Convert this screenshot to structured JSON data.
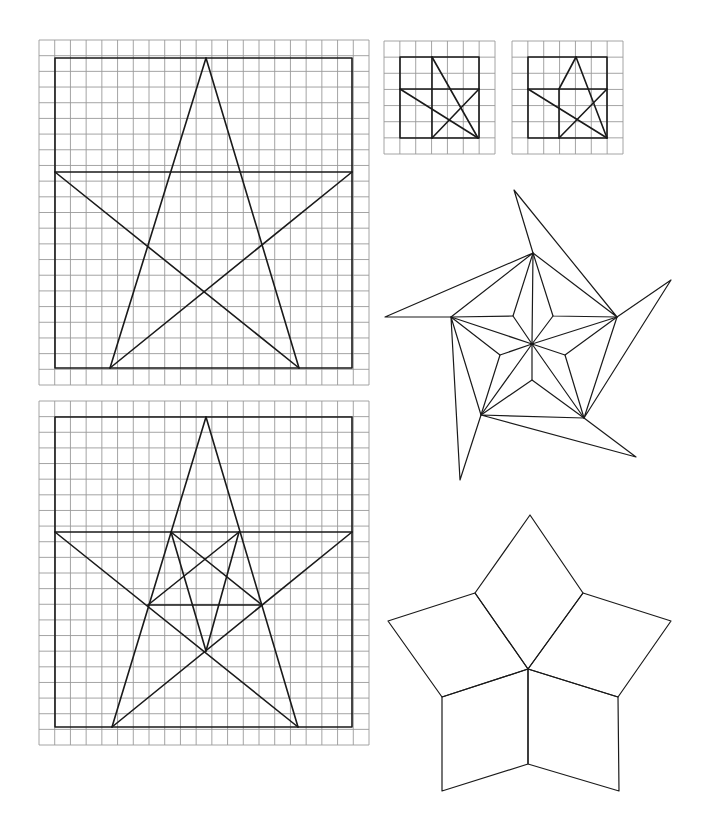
{
  "page": {
    "width": 703,
    "height": 836,
    "background": "#ffffff",
    "ink": "#1a1a1a",
    "grid_color": "#9a9a9a"
  },
  "figures": [
    {
      "id": "grid-star-large-top",
      "grid": {
        "x0": 39,
        "y0": 40,
        "x1": 369,
        "y1": 385,
        "cols": 21,
        "rows": 22
      },
      "frame": [
        [
          55,
          58
        ],
        [
          352,
          58
        ],
        [
          352,
          368
        ],
        [
          55,
          368
        ]
      ],
      "lines": [
        [
          [
            55,
            172
          ],
          [
            352,
            172
          ]
        ],
        [
          [
            206,
            58
          ],
          [
            110,
            368
          ]
        ],
        [
          [
            206,
            58
          ],
          [
            299,
            368
          ]
        ],
        [
          [
            55,
            172
          ],
          [
            299,
            368
          ]
        ],
        [
          [
            352,
            172
          ],
          [
            110,
            368
          ]
        ]
      ]
    },
    {
      "id": "grid-star-small-1",
      "grid": {
        "x0": 384,
        "y0": 41,
        "x1": 495,
        "y1": 154,
        "cols": 7,
        "rows": 7
      },
      "frame": [
        [
          400,
          57
        ],
        [
          479,
          57
        ],
        [
          479,
          138
        ],
        [
          400,
          138
        ]
      ],
      "lines": [
        [
          [
            400,
            89
          ],
          [
            479,
            89
          ]
        ],
        [
          [
            432,
            57
          ],
          [
            432,
            138
          ]
        ],
        [
          [
            432,
            57
          ],
          [
            478,
            138
          ]
        ],
        [
          [
            400,
            89
          ],
          [
            478,
            138
          ]
        ],
        [
          [
            479,
            89
          ],
          [
            432,
            138
          ]
        ]
      ]
    },
    {
      "id": "grid-star-small-2",
      "grid": {
        "x0": 512,
        "y0": 41,
        "x1": 623,
        "y1": 154,
        "cols": 7,
        "rows": 7
      },
      "frame": [
        [
          528,
          57
        ],
        [
          607,
          57
        ],
        [
          607,
          138
        ],
        [
          528,
          138
        ]
      ],
      "lines": [
        [
          [
            528,
            89
          ],
          [
            607,
            89
          ]
        ],
        [
          [
            576,
            57
          ],
          [
            559,
            89
          ]
        ],
        [
          [
            559,
            89
          ],
          [
            559,
            138
          ]
        ],
        [
          [
            576,
            57
          ],
          [
            607,
            138
          ]
        ],
        [
          [
            528,
            89
          ],
          [
            607,
            138
          ]
        ],
        [
          [
            607,
            89
          ],
          [
            559,
            138
          ]
        ]
      ]
    },
    {
      "id": "grid-star-large-bottom",
      "grid": {
        "x0": 39,
        "y0": 401,
        "x1": 369,
        "y1": 745,
        "cols": 21,
        "rows": 22
      },
      "frame": [
        [
          55,
          417
        ],
        [
          352,
          417
        ],
        [
          352,
          727
        ],
        [
          55,
          727
        ]
      ],
      "lines": [
        [
          [
            55,
            532
          ],
          [
            352,
            532
          ]
        ],
        [
          [
            206,
            417
          ],
          [
            112,
            727
          ]
        ],
        [
          [
            206,
            417
          ],
          [
            298,
            727
          ]
        ],
        [
          [
            55,
            532
          ],
          [
            298,
            727
          ]
        ],
        [
          [
            352,
            532
          ],
          [
            112,
            727
          ]
        ],
        [
          [
            148,
            605
          ],
          [
            262,
            605
          ]
        ],
        [
          [
            171,
            532
          ],
          [
            206,
            651
          ]
        ],
        [
          [
            239,
            532
          ],
          [
            206,
            651
          ]
        ],
        [
          [
            171,
            532
          ],
          [
            262,
            605
          ]
        ],
        [
          [
            239,
            532
          ],
          [
            148,
            605
          ]
        ]
      ]
    },
    {
      "id": "pinwheel-star",
      "center": [
        532,
        344
      ],
      "tips": [
        [
          533,
          253
        ],
        [
          617,
          317
        ],
        [
          584,
          418
        ],
        [
          481,
          415
        ],
        [
          451,
          317
        ]
      ],
      "inner": [
        [
          513,
          316
        ],
        [
          553,
          316
        ],
        [
          565,
          355
        ],
        [
          532,
          380
        ],
        [
          500,
          355
        ]
      ],
      "flaps": [
        [
          [
            533,
            253
          ],
          [
            514,
            190
          ],
          [
            617,
            317
          ]
        ],
        [
          [
            617,
            317
          ],
          [
            671,
            280
          ],
          [
            584,
            418
          ]
        ],
        [
          [
            584,
            418
          ],
          [
            636,
            457
          ],
          [
            481,
            415
          ]
        ],
        [
          [
            481,
            415
          ],
          [
            460,
            480
          ],
          [
            451,
            317
          ]
        ],
        [
          [
            451,
            317
          ],
          [
            385,
            317
          ],
          [
            533,
            253
          ]
        ]
      ]
    },
    {
      "id": "rhombus-star",
      "center": [
        528,
        669
      ],
      "rhombi": [
        [
          [
            528,
            669
          ],
          [
            475,
            593
          ],
          [
            530,
            515
          ],
          [
            583,
            593
          ]
        ],
        [
          [
            528,
            669
          ],
          [
            583,
            593
          ],
          [
            671,
            621
          ],
          [
            618,
            697
          ]
        ],
        [
          [
            528,
            669
          ],
          [
            618,
            697
          ],
          [
            619,
            791
          ],
          [
            528,
            764
          ]
        ],
        [
          [
            528,
            669
          ],
          [
            528,
            764
          ],
          [
            442,
            791
          ],
          [
            442,
            697
          ]
        ],
        [
          [
            528,
            669
          ],
          [
            442,
            697
          ],
          [
            388,
            621
          ],
          [
            475,
            593
          ]
        ]
      ]
    }
  ]
}
